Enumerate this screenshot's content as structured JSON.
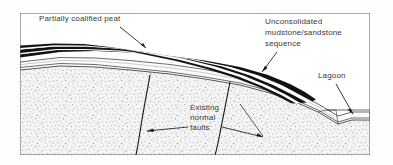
{
  "figure": {
    "frame": {
      "x": 20,
      "y": 13,
      "width": 350,
      "height": 142,
      "border_color": "#5a5a5a"
    },
    "background_color": "#fdfdfd"
  },
  "labels": {
    "peat": {
      "text": "Partially coalified peat",
      "x": 39,
      "y": 21
    },
    "mudstone": {
      "line1": "Unconsolidated",
      "line2": "mudstone/sandstone",
      "line3": "sequence",
      "x": 265,
      "y": 24,
      "line_height": 11
    },
    "lagoon": {
      "text": "Lagoon",
      "x": 318,
      "y": 78
    },
    "faults": {
      "line1": "Existing",
      "line2": "normal",
      "line3": "faults",
      "x": 190,
      "y": 110,
      "line_height": 11
    }
  },
  "layers": {
    "peat_seam_color": "#121212",
    "white_parting_color": "#ffffff",
    "mudstone_color": "#fbfbfb",
    "gravel_dot_color": "#2a2a2a",
    "basement_stipple_color": "#4a4a4a",
    "basement_base_color": "#f2f2f2",
    "outline_color": "#2b2b2b"
  },
  "features": {
    "fault_1_name": "Existing normal fault (west)",
    "fault_2_name": "Existing normal fault (east)",
    "lagoon_water_line_y": 110,
    "peat_wedge_terminates_x": 316
  }
}
